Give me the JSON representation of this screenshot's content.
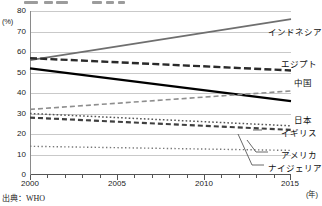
{
  "source_note": "出典：WHO",
  "chart_data": {
    "type": "line",
    "title": "",
    "xlabel": "(年)",
    "ylabel": "(%)",
    "xlim": [
      2000,
      2015
    ],
    "ylim": [
      0,
      80
    ],
    "grid": true,
    "legend_position": "right-inline-labels",
    "x_ticks": [
      "2000",
      "2005",
      "2010",
      "2015"
    ],
    "y_ticks": [
      "0",
      "10",
      "20",
      "30",
      "40",
      "50",
      "60",
      "70",
      "80"
    ],
    "x": [
      2000,
      2015
    ],
    "series": [
      {
        "name": "インドネシア",
        "label": "インドネシア",
        "style": "solid-gray",
        "color": "#6f6f6f",
        "values": [
          56,
          76
        ]
      },
      {
        "name": "エジプト",
        "label": "エジプト",
        "style": "bold-dashed",
        "color": "#2a2a2a",
        "values": [
          57,
          51
        ]
      },
      {
        "name": "日本",
        "label": "日本",
        "style": "solid-black",
        "color": "#000000",
        "values": [
          52,
          36
        ]
      },
      {
        "name": "中国",
        "label": "中国",
        "style": "light-dashed",
        "color": "#8e8e8e",
        "values": [
          32,
          41
        ]
      },
      {
        "name": "イギリス",
        "label": "イギリス",
        "style": "medium-dashed",
        "color": "#3f3f3f",
        "values": [
          28,
          22
        ]
      },
      {
        "name": "アメリカ",
        "label": "アメリカ",
        "style": "dotted",
        "color": "#555555",
        "values": [
          30,
          24
        ]
      },
      {
        "name": "ナイジェリア",
        "label": "ナイジェリア",
        "style": "fine-dotted",
        "color": "#777777",
        "values": [
          14,
          12
        ]
      }
    ]
  }
}
